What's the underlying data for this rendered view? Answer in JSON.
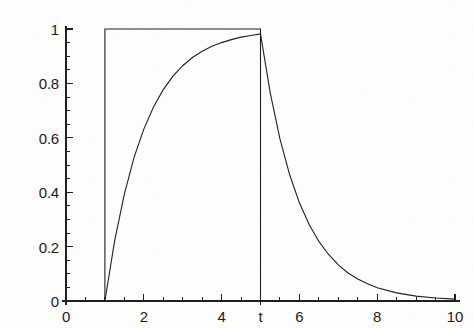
{
  "chart_data": {
    "type": "line",
    "title": "",
    "xlabel": "t",
    "ylabel": "",
    "xlim": [
      0,
      10
    ],
    "ylim": [
      0,
      1.02
    ],
    "grid": false,
    "legend_position": "none",
    "x_ticks_major": [
      0,
      2,
      4,
      6,
      8,
      10
    ],
    "x_tick_labels": [
      "0",
      "2",
      "4",
      "6",
      "8",
      "10"
    ],
    "x_minor_tick_step": 0.5,
    "y_ticks_major": [
      0,
      0.2,
      0.4,
      0.6,
      0.8,
      1
    ],
    "y_tick_labels": [
      "0",
      "0.2",
      "0.4",
      "0.6",
      "0.8",
      "1"
    ],
    "y_minor_tick_step": 0.05,
    "annotations": [
      {
        "text": "t",
        "x": 5,
        "y": 0,
        "placement": "below-axis",
        "name": "t-axis-marker"
      }
    ],
    "series": [
      {
        "name": "input-pulse",
        "kind": "rectangular-pulse",
        "style": "solid",
        "color": "#231f20",
        "width": 1.1,
        "description": "Unit rectangular pulse that switches on at t = 1 and off at t = 5",
        "points": [
          {
            "x": 0,
            "y": 0
          },
          {
            "x": 1,
            "y": 0
          },
          {
            "x": 1,
            "y": 1
          },
          {
            "x": 5,
            "y": 1
          },
          {
            "x": 5,
            "y": 0
          },
          {
            "x": 10,
            "y": 0
          }
        ]
      },
      {
        "name": "system-response",
        "kind": "exponential-charge-discharge",
        "style": "solid",
        "color": "#231f20",
        "width": 1.1,
        "description": "First order response: charges as 1-exp(-(t-1)) for 1<=t<=5, then discharges as 0.982*exp(-(t-5)) for t>5",
        "points": [
          {
            "x": 0.0,
            "y": 0.0
          },
          {
            "x": 1.0,
            "y": 0.0
          },
          {
            "x": 1.25,
            "y": 0.221
          },
          {
            "x": 1.5,
            "y": 0.393
          },
          {
            "x": 1.75,
            "y": 0.528
          },
          {
            "x": 2.0,
            "y": 0.632
          },
          {
            "x": 2.25,
            "y": 0.713
          },
          {
            "x": 2.5,
            "y": 0.777
          },
          {
            "x": 2.75,
            "y": 0.827
          },
          {
            "x": 3.0,
            "y": 0.865
          },
          {
            "x": 3.25,
            "y": 0.895
          },
          {
            "x": 3.5,
            "y": 0.918
          },
          {
            "x": 3.75,
            "y": 0.937
          },
          {
            "x": 4.0,
            "y": 0.95
          },
          {
            "x": 4.25,
            "y": 0.961
          },
          {
            "x": 4.5,
            "y": 0.97
          },
          {
            "x": 4.75,
            "y": 0.976
          },
          {
            "x": 5.0,
            "y": 0.982
          },
          {
            "x": 5.25,
            "y": 0.765
          },
          {
            "x": 5.5,
            "y": 0.596
          },
          {
            "x": 5.75,
            "y": 0.464
          },
          {
            "x": 6.0,
            "y": 0.361
          },
          {
            "x": 6.25,
            "y": 0.281
          },
          {
            "x": 6.5,
            "y": 0.219
          },
          {
            "x": 6.75,
            "y": 0.171
          },
          {
            "x": 7.0,
            "y": 0.133
          },
          {
            "x": 7.25,
            "y": 0.103
          },
          {
            "x": 7.5,
            "y": 0.081
          },
          {
            "x": 7.75,
            "y": 0.063
          },
          {
            "x": 8.0,
            "y": 0.049
          },
          {
            "x": 8.5,
            "y": 0.03
          },
          {
            "x": 9.0,
            "y": 0.018
          },
          {
            "x": 9.5,
            "y": 0.011
          },
          {
            "x": 10.0,
            "y": 0.007
          }
        ]
      }
    ]
  },
  "axes": {
    "x_axis_name": "horizontal-time-axis",
    "y_axis_name": "vertical-amplitude-axis",
    "line_color": "#231f20"
  }
}
